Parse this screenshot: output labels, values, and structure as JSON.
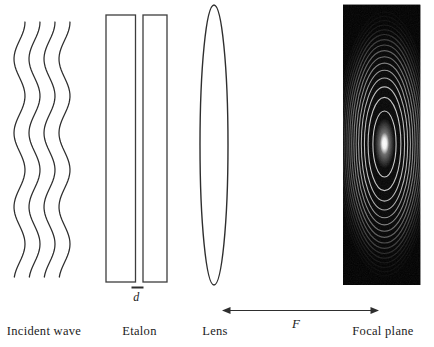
{
  "colors": {
    "background": "#ffffff",
    "line": "#2e2e2e",
    "plate_stroke": "#3d3d3d",
    "text": "#1b1b1b",
    "focal_background": "#070707",
    "ring": "#e4e4e4"
  },
  "labels": {
    "incident_wave": "Incident wave",
    "etalon": "Etalon",
    "lens": "Lens",
    "focal_length": "F",
    "focal_plane": "Focal plane",
    "plate_gap": "d"
  },
  "geometry": {
    "waves": {
      "count": 4,
      "first_center_x": 19.5,
      "spacing": 15,
      "top": 22,
      "bottom": 279,
      "amplitude": 5.5,
      "period": 74
    },
    "rings": {
      "count": 16,
      "cx": 384.5,
      "cy": 144,
      "rx_unit": 11.6,
      "ry_unit": 33,
      "base_opacity": 0.95,
      "fade": 0.03,
      "min_opacity": 0.45
    }
  }
}
